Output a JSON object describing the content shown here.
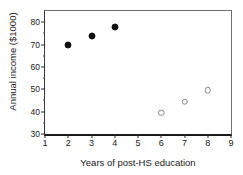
{
  "chart_data": {
    "type": "scatter",
    "title": "",
    "xlabel": "Years of post-HS education",
    "ylabel": "Annual income ($1000)",
    "xlim": [
      1,
      9
    ],
    "ylim": [
      30,
      85
    ],
    "xticks": [
      1,
      2,
      3,
      4,
      5,
      6,
      7,
      8,
      9
    ],
    "yticks": [
      30,
      40,
      50,
      60,
      70,
      80
    ],
    "y_minor_ticks": [
      35,
      45,
      55,
      65,
      75
    ],
    "grid": false,
    "legend": null,
    "series": [
      {
        "name": "filled",
        "marker": "filled-circle",
        "color": "#111111",
        "points": [
          {
            "x": 2,
            "y": 70
          },
          {
            "x": 3,
            "y": 74
          },
          {
            "x": 4,
            "y": 78
          }
        ]
      },
      {
        "name": "open",
        "marker": "open-circle",
        "color": "#8a8a8a",
        "points": [
          {
            "x": 6,
            "y": 39.5
          },
          {
            "x": 7,
            "y": 44.5
          },
          {
            "x": 8,
            "y": 49.5
          }
        ]
      }
    ]
  }
}
